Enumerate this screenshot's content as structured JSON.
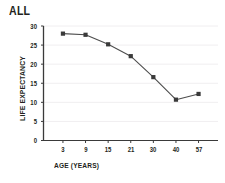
{
  "chart_data": {
    "type": "line",
    "title": "ALL",
    "xlabel": "AGE (YEARS)",
    "ylabel": "LIFE EXPECTANCY",
    "categories": [
      "3",
      "9",
      "15",
      "21",
      "30",
      "40",
      "57"
    ],
    "x_numeric": [
      3,
      9,
      15,
      21,
      30,
      40,
      57
    ],
    "values": [
      28.0,
      27.7,
      25.2,
      22.1,
      16.6,
      10.7,
      12.2
    ],
    "series": [
      {
        "name": "ALL",
        "values": [
          28.0,
          27.7,
          25.2,
          22.1,
          16.6,
          10.7,
          12.2
        ],
        "color": "#4d4d4d",
        "marker": "square",
        "marker_color": "#3a3a3a"
      }
    ],
    "ylim": [
      0,
      30
    ],
    "yticks": [
      0,
      5,
      10,
      15,
      20,
      25,
      30
    ],
    "ytick_labels": [
      "0",
      "5",
      "10",
      "15",
      "20",
      "25",
      "30"
    ],
    "xtick_labels": [
      "3",
      "9",
      "15",
      "21",
      "30",
      "40",
      "57"
    ],
    "grid": "horizontal",
    "grid_color": "#f0eef0",
    "axis_color": "#3a3a3a",
    "legend": "none",
    "background": "#ffffff"
  }
}
